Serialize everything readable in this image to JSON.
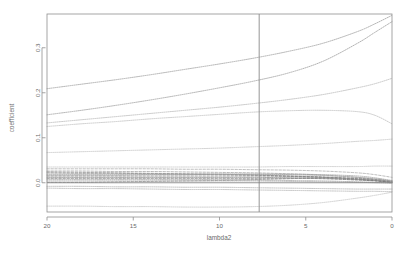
{
  "chart_data": {
    "type": "line",
    "title": "",
    "xlabel": "lambda2",
    "ylabel": "coefficient",
    "xlim": [
      20,
      0
    ],
    "ylim": [
      -0.065,
      0.375
    ],
    "x_reversed": true,
    "grid": false,
    "legend": "none",
    "xticks": [
      20,
      15,
      10,
      5,
      0
    ],
    "xtick_labels": [
      "20",
      "15",
      "10",
      "5",
      "0"
    ],
    "yticks": [
      0.0,
      0.1,
      0.2,
      0.3
    ],
    "ytick_labels": [
      "0.0",
      "0.1",
      "0.2",
      "0.3"
    ],
    "annotations": [
      {
        "type": "vline",
        "name": "selected-lambda2-line",
        "x": 7.7,
        "color": "#8a8a8a"
      },
      {
        "type": "hline",
        "name": "zero-reference-line",
        "y": 0.0,
        "color": "#7a7a7a"
      }
    ],
    "x": [
      20,
      18,
      16,
      14,
      12,
      10,
      8,
      6,
      4,
      2,
      1,
      0
    ],
    "series": [
      {
        "name": "var01",
        "style": "dotted",
        "color": "#9a9a9a",
        "values": [
          0.209,
          0.219,
          0.229,
          0.24,
          0.252,
          0.264,
          0.277,
          0.292,
          0.31,
          0.336,
          0.353,
          0.372
        ]
      },
      {
        "name": "var02",
        "style": "dotted",
        "color": "#9a9a9a",
        "values": [
          0.151,
          0.161,
          0.172,
          0.184,
          0.197,
          0.211,
          0.226,
          0.244,
          0.27,
          0.31,
          0.334,
          0.358
        ]
      },
      {
        "name": "var03",
        "style": "dotted",
        "color": "#b4b4b4",
        "values": [
          0.133,
          0.14,
          0.147,
          0.154,
          0.161,
          0.168,
          0.176,
          0.185,
          0.196,
          0.211,
          0.22,
          0.232
        ]
      },
      {
        "name": "var04",
        "style": "dotted",
        "color": "#bcbcbc",
        "values": [
          0.125,
          0.131,
          0.136,
          0.142,
          0.147,
          0.152,
          0.157,
          0.16,
          0.161,
          0.158,
          0.15,
          0.131
        ]
      },
      {
        "name": "var05",
        "style": "dotted",
        "color": "#c0c0c0",
        "values": [
          0.067,
          0.069,
          0.071,
          0.073,
          0.075,
          0.077,
          0.08,
          0.083,
          0.087,
          0.092,
          0.094,
          0.097
        ]
      },
      {
        "name": "var06",
        "style": "dotted",
        "color": "#c4c4c4",
        "values": [
          0.035,
          0.035,
          0.035,
          0.035,
          0.035,
          0.035,
          0.035,
          0.036,
          0.036,
          0.036,
          0.037,
          0.037
        ]
      },
      {
        "name": "var07",
        "style": "dashed",
        "color": "#a8a8a8",
        "values": [
          0.031,
          0.031,
          0.031,
          0.031,
          0.03,
          0.03,
          0.029,
          0.028,
          0.026,
          0.022,
          0.018,
          0.012
        ]
      },
      {
        "name": "var08",
        "style": "dashed",
        "color": "#9e9e9e",
        "values": [
          0.026,
          0.026,
          0.025,
          0.025,
          0.024,
          0.023,
          0.022,
          0.02,
          0.017,
          0.012,
          0.008,
          0.003
        ]
      },
      {
        "name": "var09",
        "style": "dashed",
        "color": "#8e8e8e",
        "values": [
          0.024,
          0.023,
          0.022,
          0.021,
          0.02,
          0.019,
          0.017,
          0.015,
          0.012,
          0.008,
          0.005,
          0.001
        ]
      },
      {
        "name": "var10",
        "style": "dashed",
        "color": "#8a8a8a",
        "values": [
          0.022,
          0.021,
          0.021,
          0.02,
          0.019,
          0.018,
          0.017,
          0.015,
          0.013,
          0.009,
          0.007,
          0.004
        ]
      },
      {
        "name": "var11",
        "style": "dotted",
        "color": "#a0a0a0",
        "values": [
          0.019,
          0.019,
          0.019,
          0.019,
          0.019,
          0.019,
          0.019,
          0.018,
          0.016,
          0.012,
          0.009,
          0.004
        ]
      },
      {
        "name": "var12",
        "style": "dotted",
        "color": "#9a9a9a",
        "values": [
          0.017,
          0.017,
          0.017,
          0.018,
          0.018,
          0.019,
          0.019,
          0.019,
          0.018,
          0.015,
          0.011,
          0.005
        ]
      },
      {
        "name": "var13",
        "style": "dashed",
        "color": "#7e7e7e",
        "values": [
          0.015,
          0.015,
          0.015,
          0.015,
          0.015,
          0.015,
          0.015,
          0.014,
          0.012,
          0.008,
          0.005,
          0.001
        ]
      },
      {
        "name": "var14",
        "style": "dotted",
        "color": "#8c8c8c",
        "values": [
          0.012,
          0.012,
          0.012,
          0.012,
          0.012,
          0.012,
          0.012,
          0.011,
          0.01,
          0.007,
          0.005,
          0.002
        ]
      },
      {
        "name": "var15",
        "style": "dashed",
        "color": "#6f6f6f",
        "values": [
          0.01,
          0.01,
          0.01,
          0.01,
          0.01,
          0.01,
          0.01,
          0.01,
          0.009,
          0.006,
          0.004,
          0.001
        ]
      },
      {
        "name": "var16",
        "style": "dotted",
        "color": "#9c9c9c",
        "values": [
          0.007,
          0.007,
          0.007,
          0.007,
          0.007,
          0.007,
          0.006,
          0.005,
          0.004,
          0.002,
          0.001,
          0.0
        ]
      },
      {
        "name": "var17",
        "style": "dotted",
        "color": "#a6a6a6",
        "values": [
          0.004,
          0.004,
          0.004,
          0.004,
          0.004,
          0.004,
          0.004,
          0.003,
          0.002,
          0.001,
          0.0,
          -0.001
        ]
      },
      {
        "name": "var18",
        "style": "dashed",
        "color": "#8a8a8a",
        "values": [
          0.001,
          0.001,
          0.002,
          0.003,
          0.004,
          0.005,
          0.007,
          0.009,
          0.011,
          0.01,
          0.007,
          0.002
        ]
      },
      {
        "name": "var19",
        "style": "dotted",
        "color": "#ababab",
        "values": [
          -0.008,
          -0.008,
          -0.009,
          -0.009,
          -0.01,
          -0.01,
          -0.011,
          -0.012,
          -0.013,
          -0.014,
          -0.014,
          -0.014
        ]
      },
      {
        "name": "var20",
        "style": "dotted",
        "color": "#b0b0b0",
        "values": [
          -0.012,
          -0.013,
          -0.013,
          -0.014,
          -0.015,
          -0.015,
          -0.016,
          -0.017,
          -0.018,
          -0.019,
          -0.019,
          -0.02
        ]
      },
      {
        "name": "var21",
        "style": "dotted",
        "color": "#c2c2c2",
        "values": [
          -0.052,
          -0.052,
          -0.053,
          -0.053,
          -0.054,
          -0.054,
          -0.053,
          -0.05,
          -0.044,
          -0.034,
          -0.028,
          -0.021
        ]
      }
    ]
  },
  "plot": {
    "axis_title_y": "coefficient",
    "axis_title_x": "lambda2"
  }
}
